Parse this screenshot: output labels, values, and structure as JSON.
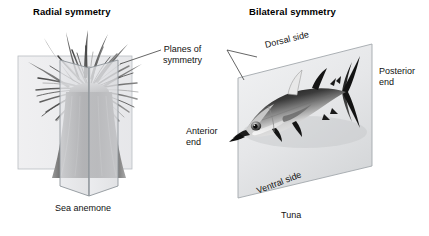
{
  "diagram": {
    "panels": [
      {
        "id": "radial",
        "title": "Radial symmetry",
        "caption": "Sea anemone",
        "organism": "sea-anemone",
        "plane_count": 2,
        "plane_arrangement": "two intersecting vertical planes through the oral-aboral axis"
      },
      {
        "id": "bilateral",
        "title": "Bilateral symmetry",
        "caption": "Tuna",
        "organism": "tuna",
        "plane_count": 1,
        "plane_arrangement": "single sagittal plane, drawn in perspective as a parallelogram",
        "labels": {
          "dorsal": "Dorsal side",
          "ventral": "Ventral side",
          "anterior": "Anterior\nend",
          "anterior_line1": "Anterior",
          "anterior_line2": "end",
          "posterior_line1": "Posterior",
          "posterior_line2": "end"
        }
      }
    ],
    "shared_label": {
      "line1": "Planes of",
      "line2": "symmetry"
    },
    "colors": {
      "background": "#ffffff",
      "text": "#111111",
      "title_text": "#000000",
      "plane_fill": "#e9eaec",
      "plane_stroke": "#9aa0a6",
      "leader_line": "#4a4a4a",
      "organism_dark": "#2b2b2b",
      "organism_mid": "#7d7d7d",
      "organism_light": "#d8d8d8"
    }
  }
}
